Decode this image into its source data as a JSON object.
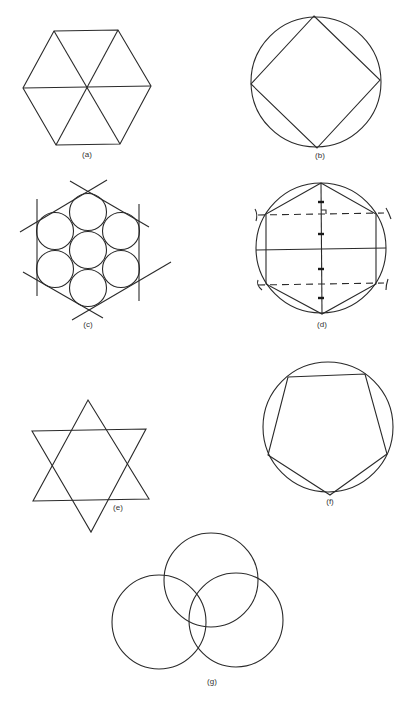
{
  "figure": {
    "type": "geometric construction plate",
    "panels": [
      {
        "id": "a",
        "label": "(a)",
        "description": "Regular hexagon divided into six equilateral triangles"
      },
      {
        "id": "b",
        "label": "(b)",
        "description": "Square inscribed in a circle"
      },
      {
        "id": "c",
        "label": "(c)",
        "description": "Seven equal circles packed inside a hexagon formed by tangent lines"
      },
      {
        "id": "d",
        "label": "(d)",
        "description": "Hexagon inscribed in a circle with dashed construction lines and arc marks"
      },
      {
        "id": "e",
        "label": "(e)",
        "description": "Six-pointed star formed by two overlapping triangles"
      },
      {
        "id": "f",
        "label": "(f)",
        "description": "Regular pentagon inscribed in a circle"
      },
      {
        "id": "g",
        "label": "(g)",
        "description": "Three overlapping circles"
      }
    ]
  },
  "colors": {
    "line": "#2a2a2a",
    "background": "#ffffff"
  }
}
